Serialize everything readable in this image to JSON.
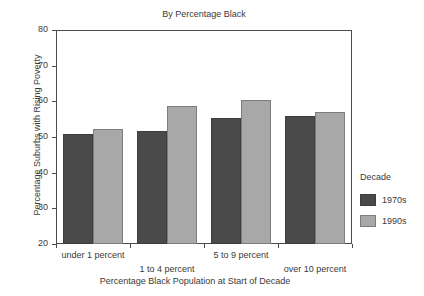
{
  "chart_data": {
    "type": "bar",
    "title": "By Percentage Black",
    "xlabel": "Percentage Black Population at Start of Decade",
    "ylabel": "Percentage Suburbs with Rising Poverty",
    "categories": [
      "under 1 percent",
      "1 to 4 percent",
      "5 to 9 percent",
      "over 10 percent"
    ],
    "series": [
      {
        "name": "1970s",
        "color": "#4a4a4a",
        "values": [
          50.8,
          51.8,
          55.3,
          55.8
        ]
      },
      {
        "name": "1990s",
        "color": "#a8a8a8",
        "values": [
          52.3,
          58.7,
          60.5,
          57.1
        ]
      }
    ],
    "ylim": [
      20,
      80
    ],
    "yticks": [
      20,
      30,
      40,
      50,
      60,
      70,
      80
    ],
    "ytick_labels": [
      "20",
      "30",
      "40",
      "50",
      "60",
      "70",
      "80"
    ],
    "grid": false,
    "legend": {
      "title": "Decade",
      "position": "right",
      "entries": [
        "1970s",
        "1990s"
      ]
    }
  }
}
